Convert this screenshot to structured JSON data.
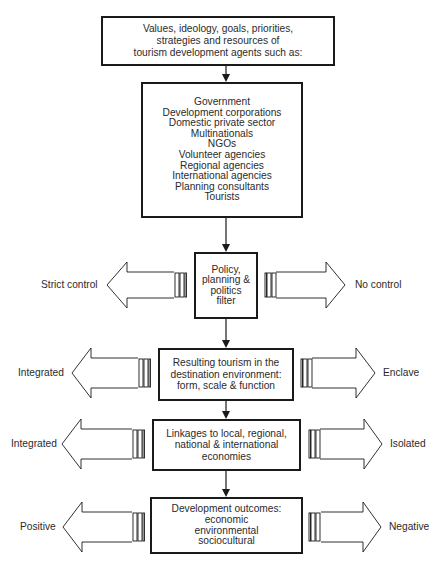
{
  "header_partial": "Figure: tourism development agents model",
  "boxes": {
    "agents_intro": {
      "lines": [
        "Values, ideology, goals, priorities,",
        "strategies and resources of",
        "tourism development agents such as:"
      ]
    },
    "agents_list": {
      "lines": [
        "Government",
        "Development corporations",
        "Domestic private sector",
        "Multinationals",
        "NGOs",
        "Volunteer agencies",
        "Regional agencies",
        "International agencies",
        "Planning consultants",
        "Tourists"
      ]
    },
    "filter": {
      "lines": [
        "Policy,",
        "planning &",
        "politics",
        "filter"
      ]
    },
    "resulting_tourism": {
      "lines": [
        "Resulting tourism in the",
        "destination environment:",
        "form, scale & function"
      ]
    },
    "linkages": {
      "lines": [
        "Linkages to local, regional,",
        "national & international",
        "economies"
      ]
    },
    "outcomes": {
      "lines": [
        "Development outcomes:",
        "economic",
        "environmental",
        "sociocultural"
      ]
    }
  },
  "spectrum_labels": {
    "filter": {
      "left": "Strict control",
      "right": "No control"
    },
    "resulting_tourism": {
      "left": "Integrated",
      "right": "Enclave"
    },
    "linkages": {
      "left": "Integrated",
      "right": "Isolated"
    },
    "outcomes": {
      "left": "Positive",
      "right": "Negative"
    }
  },
  "colors": {
    "stroke": "#1a1a1a",
    "text": "#2b2b2b",
    "background": "#ffffff"
  }
}
